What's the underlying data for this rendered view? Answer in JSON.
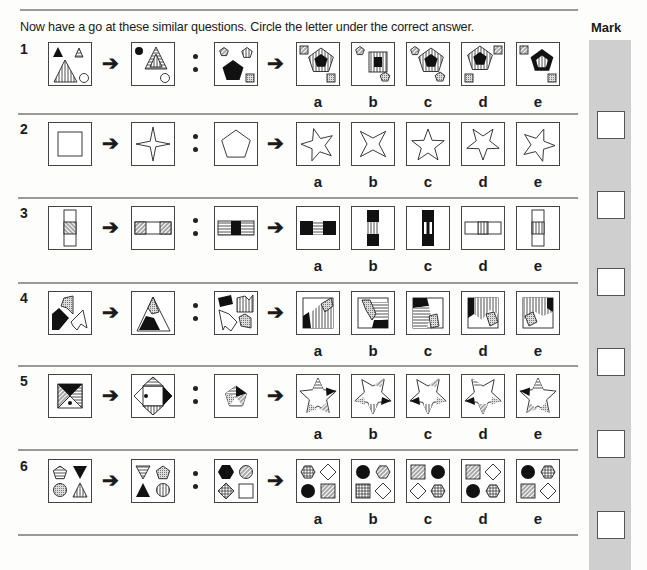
{
  "instruction": "Now have a go at these similar questions. Circle the letter under the correct answer.",
  "mark_label": "Mark",
  "option_letters": [
    "a",
    "b",
    "c",
    "d",
    "e"
  ],
  "arrow_glyph": "➔",
  "questions": [
    {
      "number": "1",
      "description": "Triangles to pentagons analogy: shapes combine into nested concentric figure",
      "example_left": "small black triangle, small striped triangle, large vertical-striped triangle, circle",
      "example_right": "black circle, nested striped triangles, circle",
      "prompt": "hatched pentagon, vertical-striped pentagon, large black pentagon, dotted square",
      "options": [
        "a",
        "b",
        "c",
        "d",
        "e"
      ]
    },
    {
      "number": "2",
      "description": "Square becomes 4-point star; pentagon becomes 5-point star",
      "example_left": "square inside square",
      "example_right": "four-point star",
      "prompt": "pentagon",
      "options": [
        "a",
        "b",
        "c",
        "d",
        "e"
      ]
    },
    {
      "number": "3",
      "description": "Vertical strip rotates to horizontal with pattern swap",
      "example_left": "vertical strip with hatched centre",
      "example_right": "horizontal strip with hatched ends",
      "prompt": "horizontal strip black centre, striped ends",
      "options": [
        "a",
        "b",
        "c",
        "d",
        "e"
      ]
    },
    {
      "number": "4",
      "description": "Pieces assemble into one shape",
      "example_left": "three jagged pieces",
      "example_right": "assembled triangle",
      "prompt": "four jagged pieces",
      "options": [
        "a",
        "b",
        "c",
        "d",
        "e"
      ]
    },
    {
      "number": "5",
      "description": "Inner triangles fold out into star points",
      "example_left": "square with four triangular sections",
      "example_right": "diamond with triangles outside",
      "prompt": "pentagon with five triangular sections",
      "options": [
        "a",
        "b",
        "c",
        "d",
        "e"
      ]
    },
    {
      "number": "6",
      "description": "2x2 shape grid transformation",
      "example_left": "striped pentagon, black triangle, dotted circle, striped triangle",
      "example_right": "striped triangle, dotted pentagon, black triangle, striped circle",
      "prompt": "black hexagon, hatched circle, crosshatched diamond, square",
      "options": [
        "a",
        "b",
        "c",
        "d",
        "e"
      ]
    }
  ]
}
